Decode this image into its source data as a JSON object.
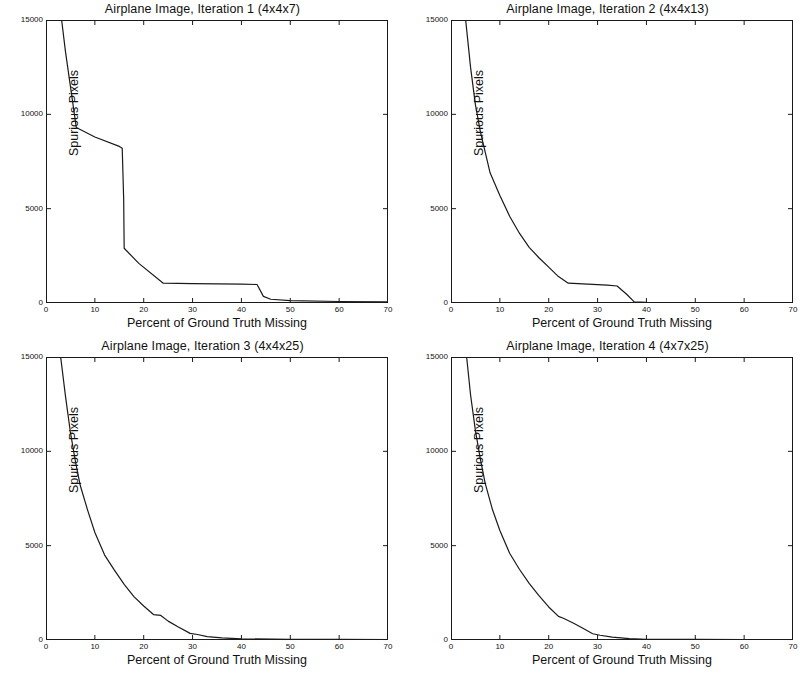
{
  "figure": {
    "background_color": "#ffffff",
    "line_color": "#1a1a1a",
    "axis_color": "#1a1a1a",
    "panel_count": 4
  },
  "chart_data": [
    {
      "type": "line",
      "title": "Airplane Image, Iteration 1 (4x4x7)",
      "xlabel": "Percent of Ground Truth Missing",
      "ylabel": "Spurious Pixels",
      "xlim": [
        0,
        70
      ],
      "ylim": [
        0,
        15000
      ],
      "xticks": [
        0,
        10,
        20,
        30,
        40,
        50,
        60,
        70
      ],
      "yticks": [
        0,
        5000,
        10000,
        15000
      ],
      "grid": false,
      "legend": null,
      "series": [
        {
          "name": "spurious pixels",
          "x": [
            3.2,
            4.0,
            6.2,
            10.0,
            15.0,
            15.6,
            15.9,
            16.0,
            19.0,
            24.0,
            30.0,
            40.0,
            43.2,
            44.5,
            46.0,
            50.0,
            60.0,
            70.0
          ],
          "y": [
            15000,
            13300,
            9300,
            8800,
            8300,
            8200,
            5500,
            2900,
            2100,
            1050,
            1030,
            1000,
            980,
            350,
            200,
            130,
            80,
            60
          ]
        }
      ]
    },
    {
      "type": "line",
      "title": "Airplane Image, Iteration 2 (4x4x13)",
      "xlabel": "Percent of Ground Truth Missing",
      "ylabel": "Spurious Pixels",
      "xlim": [
        0,
        70
      ],
      "ylim": [
        0,
        15000
      ],
      "xticks": [
        0,
        10,
        20,
        30,
        40,
        50,
        60,
        70
      ],
      "yticks": [
        0,
        5000,
        10000,
        15000
      ],
      "grid": false,
      "legend": null,
      "series": [
        {
          "name": "spurious pixels",
          "x": [
            3.0,
            4.0,
            5.0,
            6.0,
            8.0,
            10.0,
            12.0,
            14.0,
            16.0,
            18.0,
            20.0,
            22.0,
            24.0,
            28.0,
            32.0,
            34.0,
            36.0,
            37.5,
            40.0,
            70.0
          ],
          "y": [
            15000,
            12500,
            10500,
            9100,
            6900,
            5700,
            4600,
            3700,
            2950,
            2400,
            1900,
            1400,
            1050,
            1000,
            950,
            900,
            450,
            60,
            30,
            20
          ]
        }
      ]
    },
    {
      "type": "line",
      "title": "Airplane Image, Iteration 3 (4x4x25)",
      "xlabel": "Percent of Ground Truth Missing",
      "ylabel": "Spurious Pixels",
      "xlim": [
        0,
        70
      ],
      "ylim": [
        0,
        15000
      ],
      "xticks": [
        0,
        10,
        20,
        30,
        40,
        50,
        60,
        70
      ],
      "yticks": [
        0,
        5000,
        10000,
        15000
      ],
      "grid": false,
      "legend": null,
      "series": [
        {
          "name": "spurious pixels",
          "x": [
            3.0,
            4.0,
            5.0,
            6.0,
            7.0,
            8.5,
            10.0,
            12.0,
            14.0,
            16.0,
            18.0,
            20.0,
            22.0,
            23.5,
            25.0,
            27.0,
            29.5,
            31.0,
            33.0,
            36.0,
            40.0,
            50.0,
            60.0,
            70.0
          ],
          "y": [
            15000,
            12900,
            11000,
            9500,
            8200,
            6900,
            5700,
            4500,
            3700,
            2950,
            2300,
            1800,
            1350,
            1300,
            1000,
            700,
            350,
            290,
            180,
            110,
            60,
            40,
            30,
            25
          ]
        }
      ]
    },
    {
      "type": "line",
      "title": "Airplane Image, Iteration 4 (4x7x25)",
      "xlabel": "Percent of Ground Truth Missing",
      "ylabel": "Spurious Pixels",
      "xlim": [
        0,
        70
      ],
      "ylim": [
        0,
        15000
      ],
      "xticks": [
        0,
        10,
        20,
        30,
        40,
        50,
        60,
        70
      ],
      "yticks": [
        0,
        5000,
        10000,
        15000
      ],
      "grid": false,
      "legend": null,
      "series": [
        {
          "name": "spurious pixels",
          "x": [
            3.2,
            4.0,
            5.0,
            6.0,
            7.0,
            8.5,
            10.0,
            12.0,
            14.0,
            16.0,
            18.0,
            20.0,
            22.0,
            23.0,
            25.0,
            27.0,
            29.0,
            30.5,
            33.0,
            36.5,
            40.0,
            50.0,
            60.0,
            70.0
          ],
          "y": [
            15000,
            13000,
            11100,
            9600,
            8300,
            6900,
            5800,
            4600,
            3750,
            3000,
            2350,
            1750,
            1250,
            1150,
            900,
            620,
            330,
            250,
            150,
            70,
            40,
            30,
            25,
            20
          ]
        }
      ]
    }
  ]
}
